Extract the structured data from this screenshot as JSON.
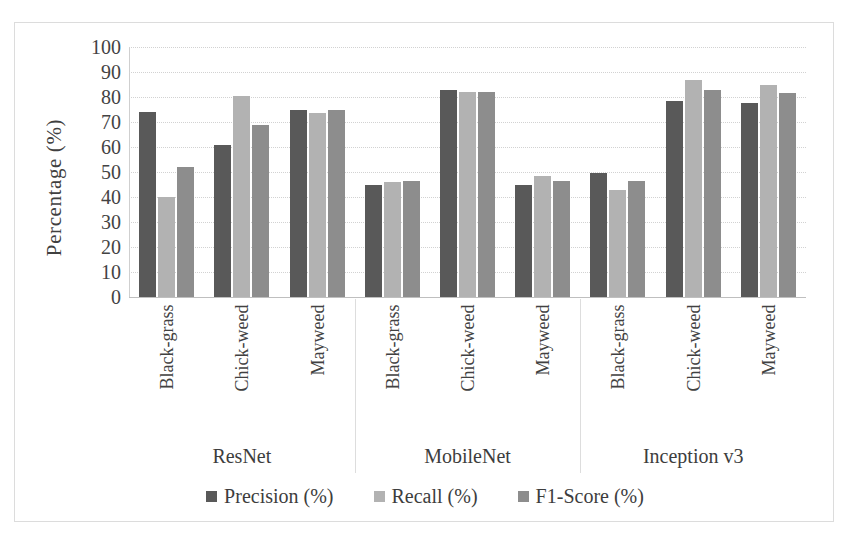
{
  "chart_data": {
    "type": "bar",
    "title": "",
    "xlabel": "",
    "ylabel": "Percentage (%)",
    "ylim": [
      0,
      100
    ],
    "ytick_step": 10,
    "yticks": [
      100,
      90,
      80,
      70,
      60,
      50,
      40,
      30,
      20,
      10,
      0
    ],
    "grid": true,
    "legend_position": "bottom",
    "groups": [
      "ResNet",
      "MobileNet",
      "Inception v3"
    ],
    "categories": [
      "Black-grass",
      "Chick-weed",
      "Mayweed"
    ],
    "series": [
      {
        "name": "Precision (%)",
        "color": "#595959",
        "values": [
          [
            74,
            61,
            75
          ],
          [
            45,
            83,
            45
          ],
          [
            49.5,
            78.5,
            77.5
          ]
        ]
      },
      {
        "name": "Recall (%)",
        "color": "#b2b2b2",
        "values": [
          [
            40,
            80.5,
            73.5
          ],
          [
            46,
            82,
            48.5
          ],
          [
            43,
            87,
            85
          ]
        ]
      },
      {
        "name": "F1-Score (%)",
        "color": "#8d8d8d",
        "values": [
          [
            52,
            69,
            75
          ],
          [
            46.5,
            82,
            46.5
          ],
          [
            46.5,
            83,
            81.5
          ]
        ]
      }
    ]
  },
  "legend": {
    "items": [
      {
        "label": "Precision (%)",
        "color": "#595959"
      },
      {
        "label": "Recall (%)",
        "color": "#b2b2b2"
      },
      {
        "label": "F1-Score (%)",
        "color": "#8d8d8d"
      }
    ]
  }
}
